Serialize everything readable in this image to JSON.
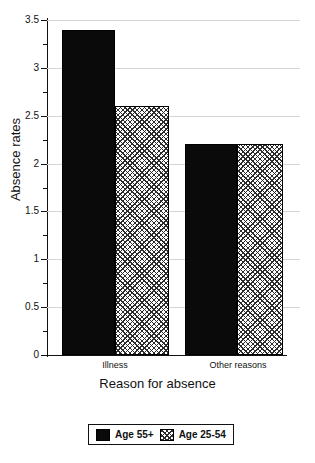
{
  "chart_data": {
    "type": "bar",
    "title": "",
    "xlabel": "Reason for absence",
    "ylabel": "Absence rates",
    "categories": [
      "Illness",
      "Other reasons"
    ],
    "series": [
      {
        "name": "Age 55+",
        "values": [
          3.4,
          2.2
        ],
        "fill": "solid",
        "color": "#0a0a0a"
      },
      {
        "name": "Age 25-54",
        "values": [
          2.6,
          2.2
        ],
        "fill": "crosshatch",
        "color": "#ffffff"
      }
    ],
    "ylim": [
      0,
      3.5
    ],
    "ytick_labels": [
      "0",
      "0.5",
      "1",
      "1.5",
      "2",
      "2.5",
      "3",
      "3.5"
    ],
    "ytick_values": [
      0,
      0.5,
      1,
      1.5,
      2,
      2.5,
      3,
      3.5
    ],
    "yminor_values": [
      0.25,
      0.75,
      1.25,
      1.75,
      2.25,
      2.75,
      3.25
    ],
    "grid": true,
    "grid_axis": "y",
    "legend_position": "bottom-center",
    "legend_border": true,
    "background": "#ffffff",
    "axis_color": "#111111",
    "grid_color": "#d6d6d6"
  }
}
